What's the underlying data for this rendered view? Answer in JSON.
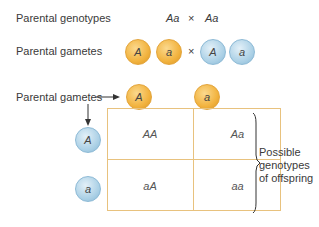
{
  "labels": {
    "parental_genotypes": "Parental genotypes",
    "parental_gametes_top": "Parental gametes",
    "parental_gametes_grid": "Parental gametes",
    "possible_genotypes": [
      "Possible",
      "genotypes",
      "of offspring"
    ]
  },
  "genotypes": {
    "left": "Aa",
    "cross": "×",
    "right": "Aa"
  },
  "gametes_row": {
    "orange": [
      "A",
      "a"
    ],
    "cross": "×",
    "blue": [
      "A",
      "a"
    ]
  },
  "punnett": {
    "columns": [
      "A",
      "a"
    ],
    "rows": [
      "A",
      "a"
    ],
    "cells": [
      [
        "AA",
        "Aa"
      ],
      [
        "aA",
        "aa"
      ]
    ]
  },
  "colors": {
    "orange_gamete": "#f2b33f",
    "blue_gamete": "#a9cfe5",
    "grid_border": "#e8c27e"
  }
}
